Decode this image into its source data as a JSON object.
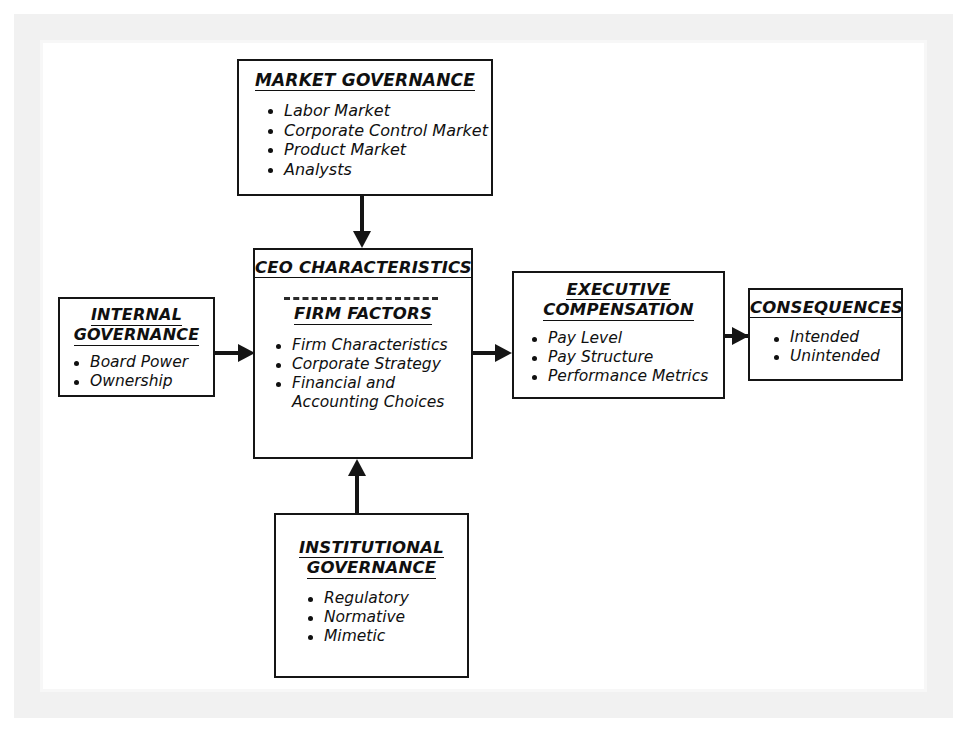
{
  "diagram": {
    "boxes": {
      "market_governance": {
        "title_lines": [
          "MARKET GOVERNANCE"
        ],
        "items": [
          "Labor Market",
          "Corporate Control Market",
          "Product Market",
          "Analysts"
        ]
      },
      "internal_governance": {
        "title_lines": [
          "INTERNAL",
          "GOVERNANCE"
        ],
        "items": [
          "Board Power",
          "Ownership"
        ]
      },
      "ceo_firm": {
        "title_lines": [
          "CEO CHARACTERISTICS"
        ],
        "subtitle_lines": [
          "FIRM FACTORS"
        ],
        "items": [
          "Firm Characteristics",
          "Corporate Strategy",
          "Financial and\nAccounting Choices"
        ]
      },
      "executive_compensation": {
        "title_lines": [
          "EXECUTIVE",
          "COMPENSATION"
        ],
        "items": [
          "Pay Level",
          "Pay Structure",
          "Performance Metrics"
        ]
      },
      "consequences": {
        "title_lines": [
          "CONSEQUENCES"
        ],
        "items": [
          "Intended",
          "Unintended"
        ]
      },
      "institutional_governance": {
        "title_lines": [
          "INSTITUTIONAL",
          "GOVERNANCE"
        ],
        "items": [
          "Regulatory",
          "Normative",
          "Mimetic"
        ]
      }
    },
    "connectors": [
      {
        "name": "market-to-ceo",
        "direction": "down"
      },
      {
        "name": "internal-to-ceo",
        "direction": "right"
      },
      {
        "name": "ceo-to-compensation",
        "direction": "right"
      },
      {
        "name": "compensation-to-consequences",
        "direction": "right"
      },
      {
        "name": "institutional-to-ceo",
        "direction": "up"
      }
    ],
    "colors": {
      "line": "#151515",
      "text": "#101010",
      "background": "#ffffff",
      "scan_border": "#f1f1f1"
    }
  }
}
